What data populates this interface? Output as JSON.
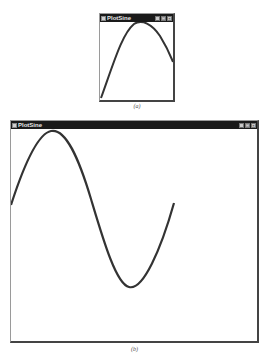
{
  "windows": {
    "small": {
      "title": "PlotSine",
      "controls": [
        "_",
        "□",
        "×"
      ],
      "caption": "(a)"
    },
    "large": {
      "title": "PlotSine",
      "controls": [
        "_",
        "□",
        "×"
      ],
      "caption": "(b)"
    }
  },
  "colors": {
    "titlebar": "#1a1a1a",
    "curve": "#333333",
    "client": "#ffffff"
  }
}
